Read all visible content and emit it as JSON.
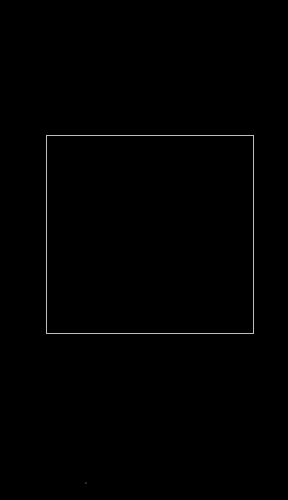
{
  "screen": {
    "background_color": "#000000"
  },
  "scan_frame": {
    "border_color": "#bdbdbd",
    "x": 46,
    "y": 135,
    "width": 207,
    "height": 198
  },
  "indicator": {
    "color": "#3a3a3a"
  }
}
